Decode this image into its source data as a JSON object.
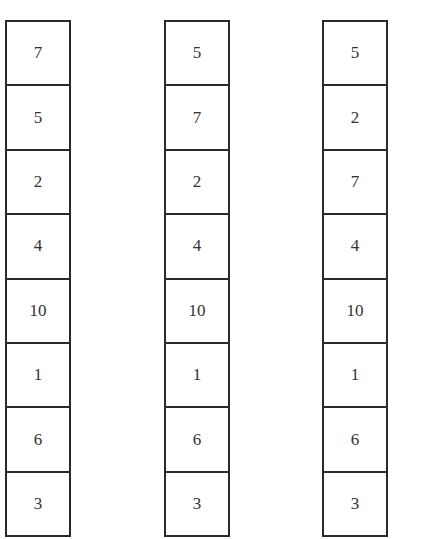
{
  "diagram": {
    "type": "array-sequence",
    "columns": [
      {
        "label": "",
        "values": [
          "7",
          "5",
          "2",
          "4",
          "10",
          "1",
          "6",
          "3"
        ]
      },
      {
        "label": "",
        "values": [
          "5",
          "7",
          "2",
          "4",
          "10",
          "1",
          "6",
          "3"
        ]
      },
      {
        "label": "",
        "values": [
          "5",
          "2",
          "7",
          "4",
          "10",
          "1",
          "6",
          "3"
        ]
      }
    ]
  }
}
